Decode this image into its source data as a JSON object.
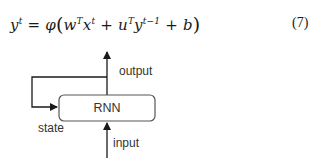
{
  "equation": {
    "lhs": "y",
    "lhs_sup": "t",
    "equals": "=",
    "func": "φ",
    "open_paren": "(",
    "term1_base": "w",
    "term1_sup": "T",
    "term1_var": "x",
    "term1_var_sup": "t",
    "plus1": "+",
    "term2_base": "u",
    "term2_sup": "T",
    "term2_var": "y",
    "term2_var_sup": "t−1",
    "plus2": "+",
    "bias": "b",
    "close_paren": ")",
    "number": "(7)"
  },
  "diagram": {
    "node_label": "RNN",
    "output_label": "output",
    "state_label": "state",
    "input_label": "input",
    "colors": {
      "stroke": "#1a1a1a",
      "text": "#333333",
      "box_fill": "#ffffff"
    }
  }
}
